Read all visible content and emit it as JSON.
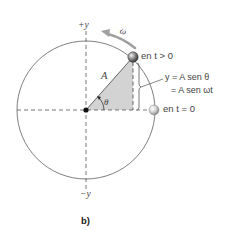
{
  "figure": {
    "panel_label": "b)",
    "axis_labels": {
      "pos_y": "+y",
      "neg_y": "−y"
    },
    "omega_label": "ω",
    "radius_label": "A",
    "angle_label": "θ",
    "ball_top_label": "en t > 0",
    "ball_right_label": "en t = 0",
    "equation_line1": "y = A sen θ",
    "equation_line2": "= A sen ωt",
    "colors": {
      "circle": "#6e6e6e",
      "axes": "#555555",
      "triangle_fill": "#d0d0d0",
      "omega_arrow": "#9a9a9a",
      "ball": "#8a8a8a",
      "center_dot": "#111111"
    }
  }
}
